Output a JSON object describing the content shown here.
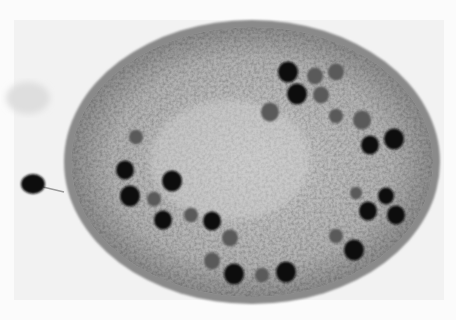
{
  "image": {
    "subject": "micrograph of oval cell with dark granules",
    "colors": {
      "background": "#fbfbfb",
      "panel": "#f1f1f1",
      "cytoplasm": "#a8a8a8",
      "cytoplasm_light": "#c8c8c8",
      "membrane": "#7a7a7a",
      "granule_dark": "#111111",
      "granule_mid": "#5a5a5a"
    },
    "granules": [
      {
        "x": 288,
        "y": 72,
        "r": 10,
        "tone": "dark"
      },
      {
        "x": 315,
        "y": 76,
        "r": 8,
        "tone": "mid"
      },
      {
        "x": 336,
        "y": 72,
        "r": 8,
        "tone": "mid"
      },
      {
        "x": 297,
        "y": 94,
        "r": 10,
        "tone": "dark"
      },
      {
        "x": 321,
        "y": 95,
        "r": 8,
        "tone": "mid"
      },
      {
        "x": 270,
        "y": 112,
        "r": 9,
        "tone": "mid"
      },
      {
        "x": 336,
        "y": 116,
        "r": 7,
        "tone": "mid"
      },
      {
        "x": 362,
        "y": 120,
        "r": 9,
        "tone": "mid"
      },
      {
        "x": 394,
        "y": 139,
        "r": 10,
        "tone": "dark"
      },
      {
        "x": 370,
        "y": 145,
        "r": 9,
        "tone": "dark"
      },
      {
        "x": 136,
        "y": 137,
        "r": 7,
        "tone": "mid"
      },
      {
        "x": 125,
        "y": 170,
        "r": 9,
        "tone": "dark"
      },
      {
        "x": 172,
        "y": 181,
        "r": 10,
        "tone": "dark"
      },
      {
        "x": 130,
        "y": 196,
        "r": 10,
        "tone": "dark"
      },
      {
        "x": 154,
        "y": 199,
        "r": 7,
        "tone": "mid"
      },
      {
        "x": 163,
        "y": 220,
        "r": 9,
        "tone": "dark"
      },
      {
        "x": 191,
        "y": 215,
        "r": 7,
        "tone": "mid"
      },
      {
        "x": 212,
        "y": 221,
        "r": 9,
        "tone": "dark"
      },
      {
        "x": 230,
        "y": 238,
        "r": 8,
        "tone": "mid"
      },
      {
        "x": 212,
        "y": 261,
        "r": 8,
        "tone": "mid"
      },
      {
        "x": 234,
        "y": 274,
        "r": 10,
        "tone": "dark"
      },
      {
        "x": 262,
        "y": 275,
        "r": 7,
        "tone": "mid"
      },
      {
        "x": 286,
        "y": 272,
        "r": 10,
        "tone": "dark"
      },
      {
        "x": 354,
        "y": 250,
        "r": 10,
        "tone": "dark"
      },
      {
        "x": 336,
        "y": 236,
        "r": 7,
        "tone": "mid"
      },
      {
        "x": 368,
        "y": 211,
        "r": 9,
        "tone": "dark"
      },
      {
        "x": 386,
        "y": 196,
        "r": 8,
        "tone": "dark"
      },
      {
        "x": 396,
        "y": 215,
        "r": 9,
        "tone": "dark"
      },
      {
        "x": 356,
        "y": 193,
        "r": 6,
        "tone": "mid"
      }
    ],
    "external_granule": {
      "x": 33,
      "y": 184,
      "r": 10
    }
  }
}
